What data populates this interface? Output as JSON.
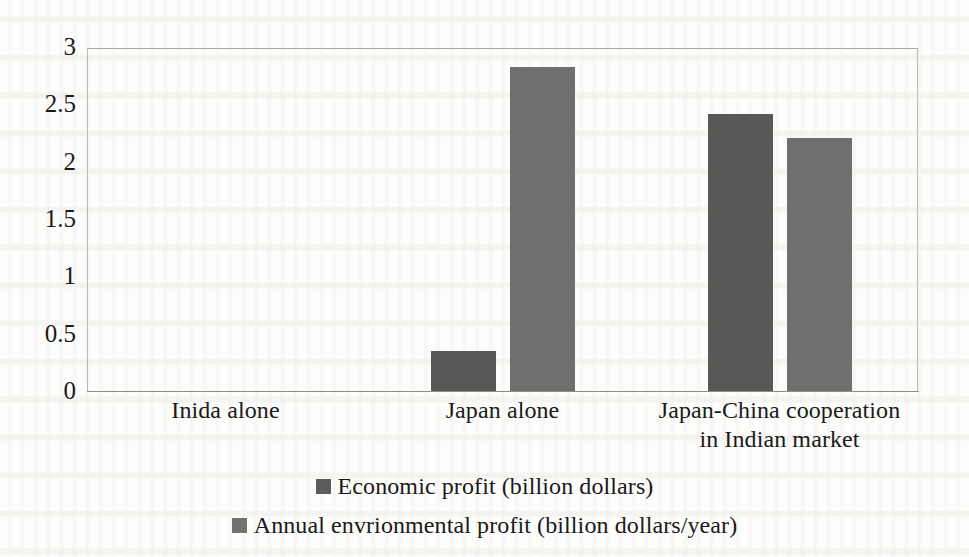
{
  "chart_data": {
    "type": "bar",
    "title": "",
    "subtitle": "",
    "xlabel": "",
    "ylabel": "",
    "categories": [
      "Inida alone",
      "Japan alone",
      "Japan-China cooperation\nin Indian market"
    ],
    "category_lines": [
      [
        "Inida alone"
      ],
      [
        "Japan alone"
      ],
      [
        "Japan-China cooperation",
        "in Indian market"
      ]
    ],
    "series": [
      {
        "name": "Economic profit (billion dollars)",
        "color": "#585856",
        "values": [
          0,
          0.35,
          2.42
        ]
      },
      {
        "name": "Annual envrionmental profit (billion dollars/year)",
        "color": "#6f6f6d",
        "values": [
          0,
          2.83,
          2.21
        ]
      }
    ],
    "ylim": [
      0,
      3
    ],
    "ytick_labels": [
      "0",
      "0.5",
      "1",
      "1.5",
      "2",
      "2.5",
      "3"
    ],
    "ytick_values": [
      0,
      0.5,
      1,
      1.5,
      2,
      2.5,
      3
    ],
    "grid": false,
    "legend_position": "bottom",
    "plot_border": true
  },
  "legend": {
    "entries": [
      {
        "label": "Economic profit (billion dollars)",
        "swatch": "legend-swatch-economic-profit"
      },
      {
        "label": "Annual envrionmental profit (billion dollars/year)",
        "swatch": "legend-swatch-environmental-profit"
      }
    ]
  }
}
